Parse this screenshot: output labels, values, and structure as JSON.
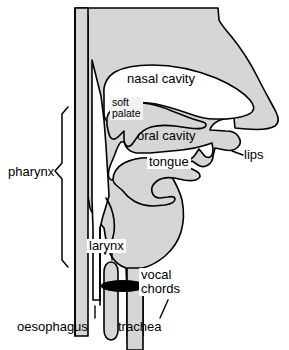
{
  "figure": {
    "type": "anatomical-diagram",
    "colors": {
      "tissue_fill": "#d6d6d6",
      "cavity_fill": "#ffffff",
      "outline": "#000000",
      "vocal_chords": "#000000",
      "soft_palate_label_bg": "#f2f2f2",
      "label_box_bg": "#ffffff",
      "page_background": "#ffffff"
    }
  },
  "labels": {
    "nasal_cavity": "nasal cavity",
    "soft_palate_line1": "soft",
    "soft_palate_line2": "palate",
    "oral_cavity": "oral cavity",
    "tongue": "tongue",
    "lips": "lips",
    "pharynx": "pharynx",
    "larynx": "larynx",
    "vocal_chords_line1": "vocal",
    "vocal_chords_line2": "chords",
    "oesophagus": "oesophagus",
    "trachea": "trachea"
  },
  "structures": [
    {
      "name": "nasal cavity",
      "kind": "cavity",
      "fill": "#ffffff"
    },
    {
      "name": "soft palate",
      "kind": "tissue",
      "fill": "#d6d6d6"
    },
    {
      "name": "oral cavity",
      "kind": "cavity",
      "fill": "#ffffff"
    },
    {
      "name": "tongue",
      "kind": "tissue",
      "fill": "#d6d6d6"
    },
    {
      "name": "lips",
      "kind": "tissue",
      "fill": "#d6d6d6"
    },
    {
      "name": "pharynx",
      "kind": "cavity",
      "fill": "#ffffff"
    },
    {
      "name": "larynx",
      "kind": "tissue",
      "fill": "#d6d6d6"
    },
    {
      "name": "vocal chords",
      "kind": "tissue",
      "fill": "#000000"
    },
    {
      "name": "oesophagus",
      "kind": "tube",
      "fill": "#d6d6d6"
    },
    {
      "name": "trachea",
      "kind": "tube",
      "fill": "#d6d6d6"
    }
  ],
  "brace": {
    "name": "pharynx-brace",
    "orientation": "left-pointing"
  }
}
